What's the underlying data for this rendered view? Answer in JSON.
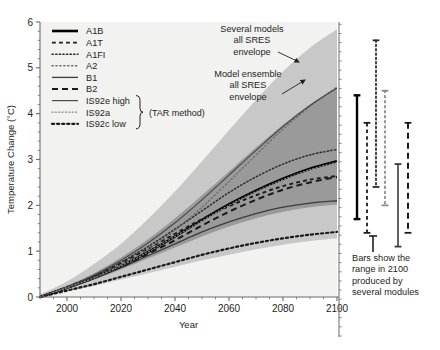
{
  "chart_data": {
    "type": "line",
    "title": "",
    "xlabel": "Year",
    "ylabel": "Temperature Change (°C)",
    "xlim": [
      1990,
      2100
    ],
    "ylim": [
      0,
      6
    ],
    "xticks": [
      2000,
      2020,
      2040,
      2060,
      2080,
      2100
    ],
    "xtick_labels": [
      "2000",
      "2020",
      "2040",
      "2060",
      "2080",
      "2100"
    ],
    "yticks": [
      0,
      1,
      2,
      3,
      4,
      5,
      6
    ],
    "ytick_labels": [
      "0",
      "1",
      "2",
      "3",
      "4",
      "5",
      "6"
    ],
    "grid": false,
    "minor_ticks": true,
    "legend_position": "upper-left inside",
    "x": [
      1990,
      2000,
      2010,
      2020,
      2030,
      2040,
      2050,
      2060,
      2070,
      2080,
      2090,
      2100
    ],
    "series": [
      {
        "name": "A1B",
        "style": "solid-thick",
        "color": "#000000",
        "width": 2.6,
        "values": [
          0.0,
          0.2,
          0.42,
          0.68,
          0.98,
          1.32,
          1.68,
          2.02,
          2.32,
          2.58,
          2.8,
          2.96
        ]
      },
      {
        "name": "A1T",
        "style": "dashed",
        "color": "#1a1a1a",
        "width": 1.9,
        "values": [
          0.0,
          0.22,
          0.46,
          0.74,
          1.05,
          1.38,
          1.7,
          1.98,
          2.22,
          2.42,
          2.56,
          2.64
        ]
      },
      {
        "name": "A1FI",
        "style": "dotted-fine",
        "color": "#2b2b2b",
        "width": 1.5,
        "values": [
          0.0,
          0.22,
          0.46,
          0.76,
          1.1,
          1.48,
          1.88,
          2.28,
          2.62,
          2.9,
          3.1,
          3.22
        ]
      },
      {
        "name": "A2",
        "style": "dotted-faint",
        "color": "#6e6e6e",
        "width": 1.4,
        "values": [
          0.0,
          0.2,
          0.42,
          0.7,
          1.04,
          1.46,
          1.96,
          2.52,
          3.1,
          3.66,
          4.16,
          4.58
        ]
      },
      {
        "name": "B1",
        "style": "solid-thin",
        "color": "#3b3b3b",
        "width": 1.3,
        "values": [
          0.0,
          0.2,
          0.4,
          0.64,
          0.9,
          1.16,
          1.42,
          1.64,
          1.82,
          1.96,
          2.05,
          2.1
        ]
      },
      {
        "name": "B2",
        "style": "dashed-long",
        "color": "#1a1a1a",
        "width": 2.0,
        "values": [
          0.0,
          0.2,
          0.42,
          0.66,
          0.94,
          1.24,
          1.56,
          1.86,
          2.12,
          2.34,
          2.5,
          2.62
        ]
      },
      {
        "name": "IS92e high",
        "style": "solid-thin",
        "color": "#4a4a4a",
        "width": 1.2,
        "values": [
          0.0,
          0.22,
          0.48,
          0.8,
          1.18,
          1.62,
          2.12,
          2.66,
          3.2,
          3.72,
          4.18,
          4.56
        ]
      },
      {
        "name": "IS92a",
        "style": "dotted-faint",
        "color": "#8a8a8a",
        "width": 1.2,
        "values": [
          0.0,
          0.2,
          0.42,
          0.68,
          0.98,
          1.32,
          1.66,
          2.0,
          2.3,
          2.56,
          2.78,
          2.94
        ]
      },
      {
        "name": "IS92c low",
        "style": "dotted-bold",
        "color": "#1a1a1a",
        "width": 2.2,
        "values": [
          0.0,
          0.14,
          0.28,
          0.44,
          0.6,
          0.76,
          0.92,
          1.06,
          1.18,
          1.28,
          1.36,
          1.42
        ]
      }
    ],
    "envelopes": [
      {
        "name": "Several models all SRES envelope",
        "color": "#c8c8c8",
        "upper": [
          0.06,
          0.34,
          0.72,
          1.16,
          1.7,
          2.3,
          2.96,
          3.64,
          4.3,
          4.92,
          5.44,
          5.84
        ],
        "lower": [
          0.0,
          0.12,
          0.24,
          0.38,
          0.52,
          0.66,
          0.8,
          0.92,
          1.04,
          1.14,
          1.22,
          1.28
        ]
      },
      {
        "name": "Model ensemble all SRES envelope",
        "color": "#9a9a9a",
        "upper": [
          0.02,
          0.24,
          0.52,
          0.86,
          1.26,
          1.72,
          2.22,
          2.74,
          3.26,
          3.76,
          4.2,
          4.58
        ],
        "lower": [
          0.0,
          0.18,
          0.38,
          0.6,
          0.84,
          1.08,
          1.32,
          1.54,
          1.72,
          1.86,
          1.96,
          2.02
        ]
      }
    ],
    "range_bars": [
      {
        "name": "A1B",
        "style": "solid-thick",
        "color": "#000000",
        "low": 1.7,
        "high": 4.4,
        "x_px": 357
      },
      {
        "name": "A1T",
        "style": "dashed",
        "color": "#1a1a1a",
        "low": 1.4,
        "high": 3.8,
        "x_px": 367
      },
      {
        "name": "A1FI",
        "style": "dotted-fine",
        "color": "#2b2b2b",
        "low": 2.4,
        "high": 5.6,
        "x_px": 376
      },
      {
        "name": "A2",
        "style": "dotted-faint",
        "color": "#8a8a8a",
        "low": 2.0,
        "high": 4.5,
        "x_px": 385
      },
      {
        "name": "B1",
        "style": "solid-thin",
        "color": "#3b3b3b",
        "low": 1.1,
        "high": 2.9,
        "x_px": 398
      },
      {
        "name": "B2",
        "style": "dashed-long",
        "color": "#1a1a1a",
        "low": 1.4,
        "high": 3.8,
        "x_px": 408
      }
    ],
    "annotations": [
      {
        "name": "several-models-annotation",
        "lines": [
          "Several models",
          "all SRES",
          "envelope"
        ]
      },
      {
        "name": "model-ensemble-annotation",
        "lines": [
          "Model ensemble",
          "all SRES",
          "envelope"
        ]
      },
      {
        "name": "bars-caption",
        "lines": [
          "Bars show the",
          "range in 2100",
          "produced by",
          "several modules"
        ]
      }
    ],
    "legend_note": "(TAR method)",
    "legend_note_group": [
      "IS92e high",
      "IS92a",
      "IS92c low"
    ]
  },
  "axes": {
    "ylabel": "Temperature Change (°C)",
    "xlabel": "Year"
  },
  "legend": {
    "items": [
      {
        "label": "A1B"
      },
      {
        "label": "A1T"
      },
      {
        "label": "A1FI"
      },
      {
        "label": "A2"
      },
      {
        "label": "B1"
      },
      {
        "label": "B2"
      },
      {
        "label": "IS92e high"
      },
      {
        "label": "IS92a"
      },
      {
        "label": "IS92c low"
      }
    ],
    "note": "(TAR method)"
  },
  "annotations": {
    "several_models": [
      "Several models",
      "all SRES",
      "envelope"
    ],
    "model_ensemble": [
      "Model ensemble",
      "all SRES",
      "envelope"
    ],
    "bars_caption": [
      "Bars show the",
      "range in 2100",
      "produced by",
      "several modules"
    ]
  },
  "ticks": {
    "x": [
      "2000",
      "2020",
      "2040",
      "2060",
      "2080",
      "2100"
    ],
    "y": [
      "0",
      "1",
      "2",
      "3",
      "4",
      "5",
      "6"
    ]
  },
  "colors": {
    "outer_envelope": "#c8c8c8",
    "inner_envelope": "#9a9a9a",
    "plot_bg": "#f2f2f0",
    "axis": "#6b6b6b",
    "text": "#231f20"
  }
}
